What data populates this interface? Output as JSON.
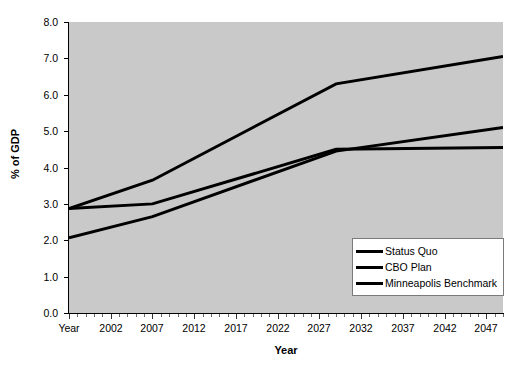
{
  "chart_data": {
    "type": "line",
    "title": "",
    "xlabel": "Year",
    "ylabel": "% of GDP",
    "xlim": [
      1997,
      2049
    ],
    "ylim": [
      0.0,
      8.0
    ],
    "grid": false,
    "legend_position": "bottom-right",
    "x_tick_labels": [
      "Year",
      "2002",
      "2007",
      "2012",
      "2017",
      "2022",
      "2027",
      "2032",
      "2037",
      "2042",
      "2047"
    ],
    "x_tick_values": [
      1997,
      2002,
      2007,
      2012,
      2017,
      2022,
      2027,
      2032,
      2037,
      2042,
      2047
    ],
    "y_tick_labels": [
      "0.0",
      "1.0",
      "2.0",
      "3.0",
      "4.0",
      "5.0",
      "6.0",
      "7.0",
      "8.0"
    ],
    "y_tick_values": [
      0.0,
      1.0,
      2.0,
      3.0,
      4.0,
      5.0,
      6.0,
      7.0,
      8.0
    ],
    "series": [
      {
        "name": "Status Quo",
        "color": "#000000",
        "x": [
          1997,
          2007,
          2029,
          2049
        ],
        "values": [
          2.87,
          3.65,
          6.3,
          7.05
        ]
      },
      {
        "name": "CBO Plan",
        "color": "#000000",
        "x": [
          1997,
          2007,
          2029,
          2049
        ],
        "values": [
          2.87,
          3.0,
          4.5,
          4.55
        ]
      },
      {
        "name": "Minneapolis Benchmark",
        "color": "#000000",
        "x": [
          1997,
          2007,
          2029,
          2049
        ],
        "values": [
          2.07,
          2.65,
          4.45,
          5.1
        ]
      }
    ],
    "legend_entries": [
      "Status Quo",
      "CBO Plan",
      "Minneapolis Benchmark"
    ],
    "plot_background_color": "#c9c9c9",
    "figure_background_color": "#ffffff"
  }
}
